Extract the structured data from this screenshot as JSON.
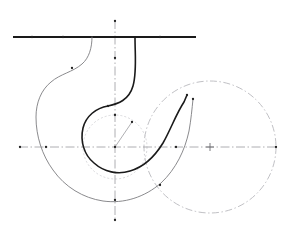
{
  "figure": {
    "width": 287,
    "height": 236,
    "background_color": "#ffffff"
  },
  "colors": {
    "bold_curve": "#1a1a1a",
    "thin_curve": "#7d7d80",
    "axis": "#9a9a9e",
    "construction_circle": "#b9b9bd",
    "inner_circle": "#cfcfd3",
    "marker": "#222222",
    "tick": "#6e6e72"
  },
  "geometry": {
    "origin": {
      "x": 115,
      "y": 147
    },
    "base_circle": {
      "cx": 115,
      "cy": 147,
      "r": 32,
      "style": "dotted"
    },
    "right_circle": {
      "cx": 210,
      "cy": 147,
      "r": 66,
      "style": "dash-dot"
    },
    "horizontal_axis": {
      "x1": 19,
      "y1": 147,
      "x2": 277,
      "y2": 147,
      "style": "dash-dot"
    },
    "vertical_axis": {
      "x1": 115,
      "y1": 20,
      "x2": 115,
      "y2": 221,
      "style": "dash-dot"
    },
    "tangent_line": {
      "x1": 13,
      "y1": 37,
      "x2": 196,
      "y2": 37,
      "style": "solid-bold"
    },
    "vector_arrow": {
      "x1": 115,
      "y1": 147,
      "x2": 132,
      "y2": 122
    }
  },
  "curves": {
    "bold_involute": {
      "name": "generated-involute-bold",
      "stroke_width": 1.6,
      "start_point": {
        "x": 135,
        "y": 37
      },
      "end_point": {
        "x": 187,
        "y": 95
      },
      "path": "M135,37 C135,56 137,72 133,86 C129,100 118,104 108,106 C96,108 86,116 83,128 C80,141 84,155 94,163 C104,172 118,175 130,171 C144,167 155,156 163,143 C171,129 176,114 184,102 L187,95"
    },
    "thin_involute": {
      "name": "generated-involute-thin",
      "stroke_width": 0.9,
      "start_point": {
        "x": 92,
        "y": 37
      },
      "end_point": {
        "x": 193,
        "y": 99
      },
      "path": "M92,37 C92,48 89,58 82,64 C73,72 60,74 51,82 C41,90 36,103 36,117 C36,136 42,155 53,170 C65,187 83,198 103,201 C124,204 145,197 161,183 C176,169 185,150 189,131 C191,120 192,109 193,99"
    }
  },
  "markers": {
    "points": [
      {
        "name": "bold-curve-endpoint",
        "x": 187,
        "y": 95
      },
      {
        "name": "thin-curve-endpoint",
        "x": 193,
        "y": 99
      },
      {
        "name": "bold-curve-inflection",
        "x": 108,
        "y": 106
      },
      {
        "name": "thin-curve-inflection",
        "x": 72,
        "y": 68
      },
      {
        "name": "thin-curve-lower-node",
        "x": 160,
        "y": 185
      },
      {
        "name": "origin-point",
        "x": 115,
        "y": 147
      },
      {
        "name": "vector-tip",
        "x": 132,
        "y": 122
      },
      {
        "name": "base-circle-top-node",
        "x": 115,
        "y": 115
      },
      {
        "name": "axis-right-node",
        "x": 176,
        "y": 147
      },
      {
        "name": "axis-left-node",
        "x": 46,
        "y": 147
      },
      {
        "name": "axis-left-end-node",
        "x": 20,
        "y": 147
      },
      {
        "name": "axis-right-end-node",
        "x": 276,
        "y": 147
      },
      {
        "name": "vertical-axis-top-node",
        "x": 115,
        "y": 21
      },
      {
        "name": "vertical-axis-mid-node",
        "x": 115,
        "y": 58
      },
      {
        "name": "vertical-axis-bottom-node",
        "x": 115,
        "y": 220
      },
      {
        "name": "vertical-axis-lower-node",
        "x": 115,
        "y": 200
      },
      {
        "name": "tangent-line-node-left",
        "x": 32,
        "y": 37
      },
      {
        "name": "tangent-line-node-mid",
        "x": 63,
        "y": 37
      },
      {
        "name": "tangent-line-node-right",
        "x": 160,
        "y": 37
      }
    ],
    "crosses": [
      {
        "name": "right-circle-center-cross",
        "x": 210,
        "y": 147,
        "size": 4
      }
    ]
  },
  "labels": {
    "caption": ""
  }
}
